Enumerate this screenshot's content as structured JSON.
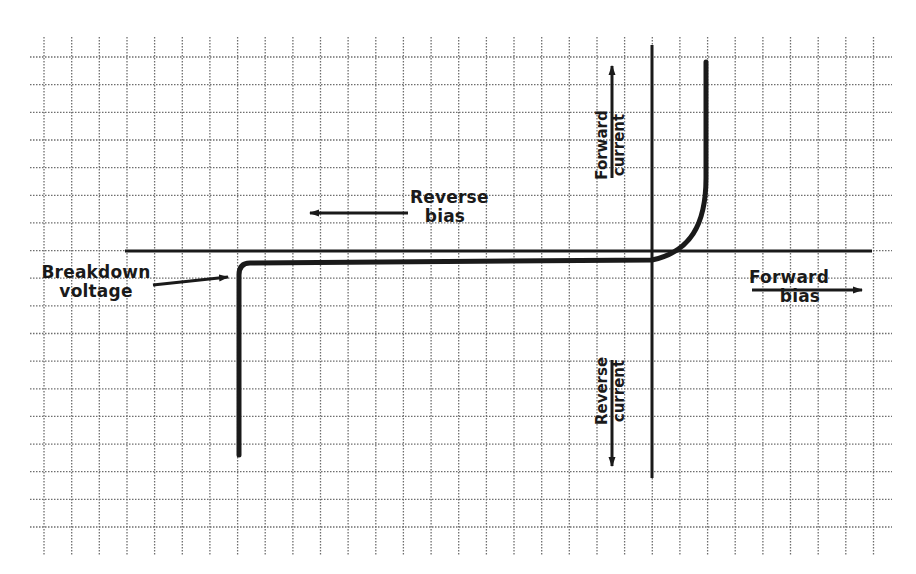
{
  "diagram": {
    "colors": {
      "ink": "#1a1a1a",
      "grid": "#6e6e6e",
      "background": "#ffffff"
    },
    "grid": {
      "x_start": 44,
      "x_end": 892,
      "y_start": 57,
      "y_end": 548,
      "spacing": 27.65,
      "style": "dotted"
    },
    "axes": {
      "x_axis": {
        "y": 251,
        "x_from": 125,
        "x_to": 872
      },
      "y_axis": {
        "x": 652,
        "y_from": 45,
        "y_to": 478
      }
    },
    "labels": {
      "reverse_bias": {
        "line1": "Reverse",
        "line2": "bias"
      },
      "forward_bias": {
        "line1": "Forward",
        "line2": "bias"
      },
      "forward_current": {
        "line1": "Forward",
        "line2": "current"
      },
      "reverse_current": {
        "line1": "Reverse",
        "line2": "current"
      },
      "breakdown_voltage": {
        "line1": "Breakdown",
        "line2": "voltage"
      }
    },
    "curve": {
      "description": "Forward conduction rises steeply right of origin; near-zero reverse leakage to the left; sharp drop at breakdown voltage",
      "path": "M 706 62 L 706 178 C 706 225 690 252 652 260 L 250 263 Q 239 263 239 275 L 239 455"
    }
  }
}
